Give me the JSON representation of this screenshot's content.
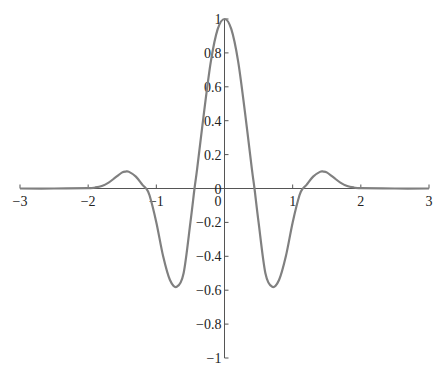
{
  "chart_data": {
    "type": "line",
    "title": "",
    "xlabel": "",
    "ylabel": "",
    "xlim": [
      -3,
      3
    ],
    "ylim": [
      -1,
      1
    ],
    "grid": false,
    "legend": null,
    "x_ticks": [
      "-3",
      "-2",
      "-1",
      "0",
      "1",
      "2",
      "3"
    ],
    "y_ticks": [
      "-1",
      "-0.8",
      "-0.6",
      "-0.4",
      "-0.2",
      "0",
      "0.2",
      "0.4",
      "0.6",
      "0.8",
      "1"
    ],
    "series": [
      {
        "name": "f(x)",
        "color": "#808080",
        "x": [
          -3,
          -2.5,
          -2.0,
          -1.9,
          -1.8,
          -1.7,
          -1.6,
          -1.5,
          -1.45,
          -1.4,
          -1.3,
          -1.2,
          -1.15,
          -1.1,
          -1.0,
          -0.9,
          -0.8,
          -0.7,
          -0.6,
          -0.5,
          -0.44,
          -0.4,
          -0.3,
          -0.2,
          -0.1,
          0,
          0.1,
          0.2,
          0.3,
          0.4,
          0.44,
          0.5,
          0.6,
          0.7,
          0.8,
          0.9,
          1.0,
          1.1,
          1.15,
          1.2,
          1.3,
          1.4,
          1.45,
          1.5,
          1.6,
          1.7,
          1.8,
          1.9,
          2.0,
          2.5,
          3
        ],
        "y": [
          0,
          0,
          0.002,
          0.006,
          0.015,
          0.035,
          0.065,
          0.095,
          0.1,
          0.098,
          0.07,
          0.02,
          0,
          -0.04,
          -0.2,
          -0.4,
          -0.54,
          -0.58,
          -0.5,
          -0.2,
          0,
          0.12,
          0.45,
          0.75,
          0.94,
          1.0,
          0.94,
          0.75,
          0.45,
          0.12,
          0,
          -0.2,
          -0.5,
          -0.58,
          -0.54,
          -0.4,
          -0.2,
          -0.04,
          0,
          0.02,
          0.07,
          0.098,
          0.1,
          0.095,
          0.065,
          0.035,
          0.015,
          0.006,
          0.002,
          0,
          0
        ]
      }
    ]
  }
}
